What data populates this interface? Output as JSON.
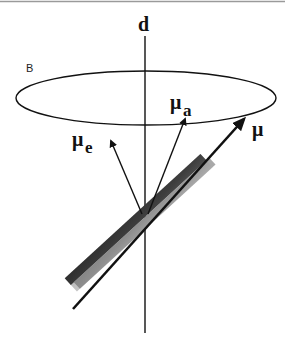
{
  "diagram": {
    "axis_label": "d",
    "field_label": "B",
    "dipole_label": "μ",
    "absorption_label_base": "μ",
    "absorption_label_sub": "a",
    "emission_label_base": "μ",
    "emission_label_sub": "e",
    "colors": {
      "line": "#111111",
      "rod_dark": "#3a3a3a",
      "rod_light": "#a8a8a8",
      "border": "#9a9a9a"
    }
  }
}
